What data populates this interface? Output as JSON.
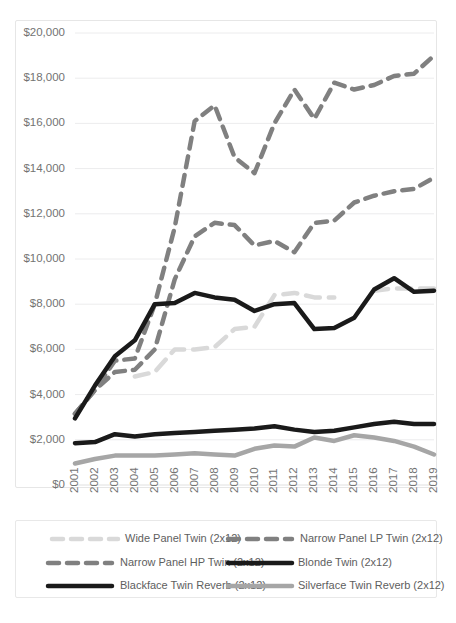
{
  "chart_data": {
    "type": "line",
    "title": "",
    "xlabel": "",
    "ylabel": "",
    "x": [
      2001,
      2002,
      2003,
      2004,
      2005,
      2006,
      2007,
      2008,
      2009,
      2010,
      2011,
      2012,
      2013,
      2014,
      2015,
      2016,
      2017,
      2018,
      2019
    ],
    "ylim": [
      0,
      20000
    ],
    "ytick_values": [
      0,
      2000,
      4000,
      6000,
      8000,
      10000,
      12000,
      14000,
      16000,
      18000,
      20000
    ],
    "ytick_labels": [
      "$0",
      "$2,000",
      "$4,000",
      "$6,000",
      "$8,000",
      "$10,000",
      "$12,000",
      "$14,000",
      "$16,000",
      "$18,000",
      "$20,000"
    ],
    "xtick_labels": [
      "2001",
      "2002",
      "2003",
      "2004",
      "2005",
      "2006",
      "2007",
      "2008",
      "2009",
      "2010",
      "2011",
      "2012",
      "2013",
      "2014",
      "2015",
      "2016",
      "2017",
      "2018",
      "2019"
    ],
    "grid": true,
    "legend_position": "bottom",
    "series": [
      {
        "name": "Wide Panel Twin (2x12)",
        "color": "#d9d9d9",
        "style": "dashed",
        "width": 4.5,
        "dasharray": "14 9",
        "values": [
          null,
          null,
          null,
          4800,
          5000,
          6000,
          6000,
          6100,
          6900,
          7000,
          8400,
          8500,
          8300,
          8300,
          null,
          8600,
          8700,
          8700,
          8700
        ]
      },
      {
        "name": "Narrow Panel LP Twin (2x12)",
        "color": "#808080",
        "style": "dashed",
        "width": 4.5,
        "dasharray": "11 8",
        "values": [
          3150,
          4200,
          5500,
          5600,
          8000,
          11400,
          16100,
          16800,
          14500,
          13800,
          16000,
          17500,
          16200,
          17800,
          17500,
          17700,
          18100,
          18200,
          19000
        ]
      },
      {
        "name": "Narrow Panel HP Twin (2x12)",
        "color": "#808080",
        "style": "dashed",
        "width": 4.5,
        "dasharray": "11 8",
        "values": [
          3150,
          4200,
          5000,
          5100,
          6000,
          9100,
          11000,
          11600,
          11500,
          10600,
          10800,
          10300,
          11600,
          11700,
          12500,
          12800,
          13000,
          13100,
          13600
        ]
      },
      {
        "name": "Blonde Twin (2x12)",
        "color": "#1a1a1a",
        "style": "solid",
        "width": 4.5,
        "dasharray": "",
        "values": [
          1850,
          1900,
          2250,
          2150,
          2250,
          2300,
          2350,
          2400,
          2450,
          2500,
          2600,
          2450,
          2350,
          2400,
          2550,
          2700,
          2800,
          2700,
          2700
        ]
      },
      {
        "name": "Blackface Twin Reverb (2x12)",
        "color": "#1a1a1a",
        "style": "solid",
        "width": 4.5,
        "dasharray": "",
        "values": [
          2950,
          4400,
          5700,
          6400,
          8000,
          8050,
          8500,
          8300,
          8200,
          7700,
          8000,
          8050,
          6900,
          6950,
          7400,
          8650,
          9150,
          8550,
          8600
        ]
      },
      {
        "name": "Silverface Twin Reverb (2x12)",
        "color": "#a6a6a6",
        "style": "solid",
        "width": 4.5,
        "dasharray": "",
        "values": [
          950,
          1150,
          1300,
          1300,
          1300,
          1350,
          1400,
          1350,
          1300,
          1600,
          1750,
          1700,
          2100,
          1950,
          2200,
          2100,
          1950,
          1700,
          1350
        ]
      }
    ]
  },
  "legend": {
    "items": [
      {
        "label": "Wide Panel Twin (2x12)"
      },
      {
        "label": "Narrow Panel LP Twin (2x12)"
      },
      {
        "label": "Narrow Panel HP Twin (2x12)"
      },
      {
        "label": "Blonde Twin (2x12)"
      },
      {
        "label": "Blackface Twin Reverb (2x12)"
      },
      {
        "label": "Silverface Twin Reverb (2x12)"
      }
    ]
  }
}
